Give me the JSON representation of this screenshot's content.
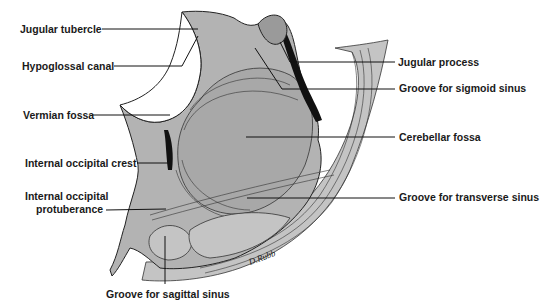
{
  "figure": {
    "labels": {
      "jugular_tubercle": "Jugular tubercle",
      "hypoglossal_canal": "Hypoglossal canal",
      "vermian_fossa": "Vermian fossa",
      "internal_occipital_crest": "Internal occipital crest",
      "internal_occipital_protuberance_1": "Internal occipital",
      "internal_occipital_protuberance_2": "protuberance",
      "groove_sagittal_sinus": "Groove for sagittal sinus",
      "jugular_process": "Jugular process",
      "groove_sigmoid_sinus": "Groove for sigmoid sinus",
      "cerebellar_fossa": "Cerebellar fossa",
      "groove_transverse_sinus": "Groove for transverse sinus"
    },
    "artist_signature": "D.Rubb",
    "colors": {
      "bone_fill": "#b3b3b3",
      "line": "#111111",
      "background": "#ffffff"
    }
  }
}
